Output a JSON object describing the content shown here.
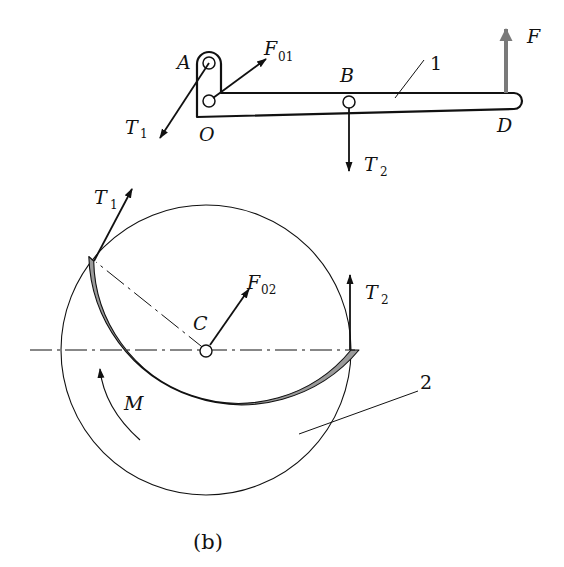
{
  "figure": {
    "caption": "(b)",
    "colors": {
      "line": "#111111",
      "band_fill": "#9a9a9a",
      "force_F": "#7a7a7a",
      "background": "#ffffff"
    }
  },
  "lever": {
    "part_number": "1",
    "points": {
      "A": "A",
      "O": "O",
      "B": "B",
      "D": "D"
    },
    "forces": {
      "F01": {
        "main": "F",
        "sub": "01"
      },
      "T1": {
        "main": "T",
        "sub": "1"
      },
      "T2": {
        "main": "T",
        "sub": "2"
      },
      "F": {
        "main": "F"
      }
    }
  },
  "drum": {
    "part_number": "2",
    "center": "C",
    "moment": "M",
    "forces": {
      "T1": {
        "main": "T",
        "sub": "1"
      },
      "T2": {
        "main": "T",
        "sub": "2"
      },
      "F02": {
        "main": "F",
        "sub": "02"
      }
    }
  }
}
